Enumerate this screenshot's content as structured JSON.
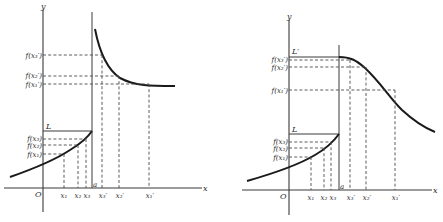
{
  "left_graph": {
    "y_axis_label": "y",
    "x_axis_label": "x",
    "origin_label": "O",
    "limit_label": "L",
    "a_label": "a",
    "y_ticks": [
      "f(x₃′)",
      "f(x₂′)",
      "f(x₁′)",
      "f(x₃)",
      "f(x₂)",
      "f(x₁)"
    ],
    "x_ticks": [
      "x₁",
      "x₂",
      "x₃",
      "x₃′",
      "x₂′",
      "x₁′"
    ]
  },
  "right_graph": {
    "y_axis_label": "y",
    "x_axis_label": "x",
    "origin_label": "O",
    "limit_label": "L",
    "limit_prime_label": "L′",
    "a_label": "a",
    "y_ticks": [
      "f(x₃′)",
      "f(x₂′)",
      "f(x₁′)",
      "f(x₃)",
      "f(x₂)",
      "f(x₁)"
    ],
    "x_ticks": [
      "x₁",
      "x₂",
      "x₃",
      "x₃′",
      "x₂′",
      "x₁′"
    ]
  }
}
